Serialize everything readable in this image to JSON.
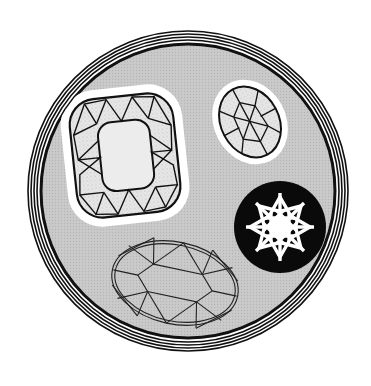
{
  "illustration": {
    "title": "Gemstone cuts emblem",
    "background": "#ffffff",
    "medallion": {
      "cx": 188,
      "cy": 191,
      "ring_radii": [
        160,
        157,
        154,
        151
      ],
      "inner_ring_radius": 147,
      "fill": "#c6c6c6",
      "ring_color": "#111111"
    },
    "gems": [
      {
        "name": "cushion-cut",
        "style": "shaded-facets-with-halo",
        "cx": 125,
        "cy": 155,
        "width": 105,
        "height": 120,
        "rotation": -6,
        "halo_color": "#ffffff",
        "body_color": "#e6e6e6",
        "table_color": "#ececec"
      },
      {
        "name": "small-oval-cut",
        "style": "shaded-facets-with-halo",
        "cx": 250,
        "cy": 122,
        "rx": 30,
        "ry": 38,
        "rotation": -28,
        "halo_color": "#ffffff",
        "body_color": "#e6e6e6"
      },
      {
        "name": "round-brilliant-star",
        "style": "white-on-black-disc",
        "cx": 280,
        "cy": 227,
        "disc_radius": 46,
        "spokes": 8,
        "disc_color": "#0a0a0a",
        "star_color": "#ffffff"
      },
      {
        "name": "oval-wireframe",
        "style": "wireframe",
        "cx": 175,
        "cy": 283,
        "rx": 63,
        "ry": 42,
        "rotation": 12,
        "line_color": "#222222"
      }
    ]
  }
}
